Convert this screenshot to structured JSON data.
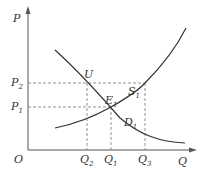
{
  "diagram": {
    "type": "supply-demand",
    "axes": {
      "y_label": "P",
      "x_label": "Q",
      "origin_label": "O"
    },
    "price_levels": [
      {
        "label": "P",
        "sub": "2",
        "y": 83
      },
      {
        "label": "P",
        "sub": "1",
        "y": 107
      }
    ],
    "quantity_levels": [
      {
        "label": "Q",
        "sub": "2",
        "x": 87
      },
      {
        "label": "Q",
        "sub": "1",
        "x": 111
      },
      {
        "label": "Q",
        "sub": "3",
        "x": 145
      }
    ],
    "points": {
      "U": {
        "label": "U"
      },
      "E1": {
        "label": "E",
        "sub": "1"
      }
    },
    "curves": {
      "supply": {
        "label": "S",
        "sub": "1"
      },
      "demand": {
        "label": "D",
        "sub": "1"
      }
    },
    "colors": {
      "axis": "#555555",
      "curve": "#333333",
      "guide": "#777777"
    }
  }
}
